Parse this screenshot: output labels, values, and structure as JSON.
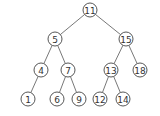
{
  "diagram": {
    "type": "binary-search-tree",
    "node_radius": 7,
    "nodes": [
      {
        "id": "n11",
        "label": "11",
        "x": 90,
        "y": 10
      },
      {
        "id": "n5",
        "label": "5",
        "x": 55,
        "y": 39
      },
      {
        "id": "n15",
        "label": "15",
        "x": 126,
        "y": 39
      },
      {
        "id": "n4",
        "label": "4",
        "x": 41,
        "y": 70
      },
      {
        "id": "n7",
        "label": "7",
        "x": 68,
        "y": 70
      },
      {
        "id": "n13",
        "label": "13",
        "x": 111,
        "y": 70
      },
      {
        "id": "n18",
        "label": "18",
        "x": 140,
        "y": 70
      },
      {
        "id": "n1",
        "label": "1",
        "x": 28,
        "y": 99
      },
      {
        "id": "n6",
        "label": "6",
        "x": 57,
        "y": 99
      },
      {
        "id": "n9",
        "label": "9",
        "x": 79,
        "y": 99
      },
      {
        "id": "n12",
        "label": "12",
        "x": 100,
        "y": 99
      },
      {
        "id": "n14",
        "label": "14",
        "x": 123,
        "y": 99
      }
    ],
    "edges": [
      [
        "n11",
        "n5"
      ],
      [
        "n11",
        "n15"
      ],
      [
        "n5",
        "n4"
      ],
      [
        "n5",
        "n7"
      ],
      [
        "n15",
        "n13"
      ],
      [
        "n15",
        "n18"
      ],
      [
        "n4",
        "n1"
      ],
      [
        "n7",
        "n6"
      ],
      [
        "n7",
        "n9"
      ],
      [
        "n13",
        "n12"
      ],
      [
        "n13",
        "n14"
      ]
    ]
  }
}
